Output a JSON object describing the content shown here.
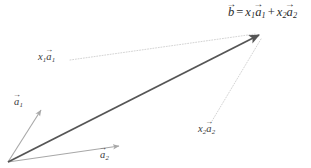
{
  "figure": {
    "width": 311,
    "height": 168,
    "background_color": "#ffffff"
  },
  "colors": {
    "resultant_vector": "#555555",
    "basis_vector": "#a8a8a8",
    "leader_line": "#cfcfcf",
    "text": "#2b2b2b"
  },
  "geometry": {
    "origin": {
      "x": 8,
      "y": 162
    },
    "vectors": [
      {
        "name": "b",
        "from": {
          "x": 8,
          "y": 162
        },
        "to": {
          "x": 262,
          "y": 33
        },
        "color": "#555555",
        "width": 1.8,
        "style": "solid",
        "arrowhead": "filled"
      },
      {
        "name": "a1",
        "from": {
          "x": 8,
          "y": 162
        },
        "to": {
          "x": 42,
          "y": 108
        },
        "color": "#a8a8a8",
        "width": 1.1,
        "style": "solid",
        "arrowhead": "open"
      },
      {
        "name": "a2",
        "from": {
          "x": 8,
          "y": 162
        },
        "to": {
          "x": 120,
          "y": 146
        },
        "color": "#a8a8a8",
        "width": 1.1,
        "style": "solid",
        "arrowhead": "open"
      }
    ],
    "leader_lines": [
      {
        "name": "x1a1-leader",
        "from": {
          "x": 70,
          "y": 60
        },
        "to": {
          "x": 255,
          "y": 34
        },
        "color": "#cfcfcf",
        "style": "dotted"
      },
      {
        "name": "x2a2-leader",
        "from": {
          "x": 212,
          "y": 121
        },
        "to": {
          "x": 261,
          "y": 39
        },
        "color": "#cfcfcf",
        "style": "dotted"
      }
    ]
  },
  "labels": {
    "equation": {
      "name": "equation-b-equals-x1a1-plus-x2a2",
      "text": "b = x1a1 + x2a2",
      "lhs_symbol": "b",
      "equals": "=",
      "term1_coefficient": "x",
      "term1_coefficient_subscript": "1",
      "term1_vector": "a",
      "term1_vector_subscript": "1",
      "plus": "+",
      "term2_coefficient": "x",
      "term2_coefficient_subscript": "2",
      "term2_vector": "a",
      "term2_vector_subscript": "2"
    },
    "x1a1": {
      "name": "label-x1-a1",
      "coefficient": "x",
      "coefficient_subscript": "1",
      "vector": "a",
      "vector_subscript": "1"
    },
    "x2a2": {
      "name": "label-x2-a2",
      "coefficient": "x",
      "coefficient_subscript": "2",
      "vector": "a",
      "vector_subscript": "2"
    },
    "a1": {
      "name": "label-a1",
      "vector": "a",
      "vector_subscript": "1"
    },
    "a2": {
      "name": "label-a2",
      "vector": "a",
      "vector_subscript": "2"
    }
  }
}
